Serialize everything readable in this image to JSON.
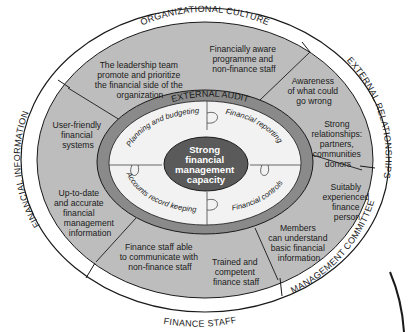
{
  "diagram": {
    "colors": {
      "outer_ring": "#ffffff",
      "segment_fill": "#bdbdbd",
      "audit_band": "#8a8a8a",
      "inner_fill": "#f2f2f2",
      "core_fill": "#5a5a5a",
      "stroke": "#1a1a1a"
    },
    "outer_ring": {
      "organizational_culture": "ORGANIZATIONAL CULTURE",
      "external_relationships": "EXTERNAL RELATIONSHIPS",
      "management_committee": "MANAGEMENT COMMITTEE",
      "finance_staff": "FINANCE STAFF",
      "financial_information": "FINANCIAL INFORMATION"
    },
    "segments": {
      "leadership": [
        "The leadership team",
        "promote and prioritize",
        "the financial side of the",
        "organization"
      ],
      "financially_aware": [
        "Financially aware",
        "programme and",
        "non-finance staff"
      ],
      "awareness": [
        "Awareness",
        "of what could",
        "go wrong"
      ],
      "relationships": [
        "Strong",
        "relationships:",
        "partners,",
        "communities",
        "donors"
      ],
      "experienced": [
        "Suitably",
        "experienced",
        "finance",
        "person"
      ],
      "members": [
        "Members",
        "can understand",
        "basic financial",
        "information"
      ],
      "trained": [
        "Trained and",
        "competent",
        "finance staff"
      ],
      "communicate": [
        "Finance staff able",
        "to communicate with",
        "non-finance staff"
      ],
      "up_to_date": [
        "Up-to-date",
        "and accurate",
        "financial",
        "management",
        "information"
      ],
      "user_friendly": [
        "User-friendly",
        "financial",
        "systems"
      ]
    },
    "audit_label": "EXTERNAL AUDIT",
    "puzzle_pieces": {
      "top_left": "Planning and budgeting",
      "top_right": "Financial reporting",
      "bottom_left": "Accounts record keeping",
      "bottom_right": "Financial controls"
    },
    "core": [
      "Strong",
      "financial",
      "management",
      "capacity"
    ]
  }
}
